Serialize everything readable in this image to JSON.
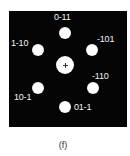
{
  "figure": {
    "caption": "(f)",
    "background_color": "#050505",
    "spot_color": "#ffffff",
    "center_spot": {
      "label": "",
      "marker": "+"
    },
    "spots": [
      {
        "label": "0-11",
        "position": "top"
      },
      {
        "label": "-101",
        "position": "upper-right"
      },
      {
        "label": "-110",
        "position": "lower-right"
      },
      {
        "label": "01-1",
        "position": "bottom"
      },
      {
        "label": "10-1",
        "position": "lower-left"
      },
      {
        "label": "1-10",
        "position": "upper-left"
      }
    ]
  }
}
